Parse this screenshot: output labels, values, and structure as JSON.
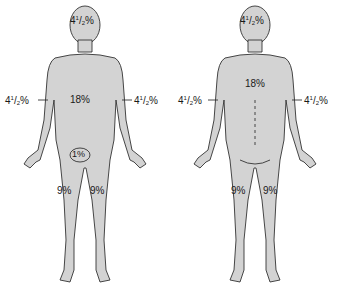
{
  "diagram": {
    "type": "rule-of-nines body surface area",
    "colors": {
      "body_fill": "#d3d3d3",
      "outline": "#333333",
      "text": "#1a1a1a"
    },
    "front": {
      "head": {
        "whole": "4",
        "num": "1",
        "den": "2",
        "pct": "%"
      },
      "trunk": "18%",
      "left_arm": {
        "whole": "4",
        "num": "1",
        "den": "2",
        "pct": "%"
      },
      "right_arm": {
        "whole": "4",
        "num": "1",
        "den": "2",
        "pct": "%"
      },
      "genitals": "1%",
      "left_leg": "9%",
      "right_leg": "9%"
    },
    "back": {
      "head": {
        "whole": "4",
        "num": "1",
        "den": "2",
        "pct": "%"
      },
      "trunk": "18%",
      "left_arm": {
        "whole": "4",
        "num": "1",
        "den": "2",
        "pct": "%"
      },
      "right_arm": {
        "whole": "4",
        "num": "1",
        "den": "2",
        "pct": "%"
      },
      "left_leg": "9%",
      "right_leg": "9%"
    }
  }
}
